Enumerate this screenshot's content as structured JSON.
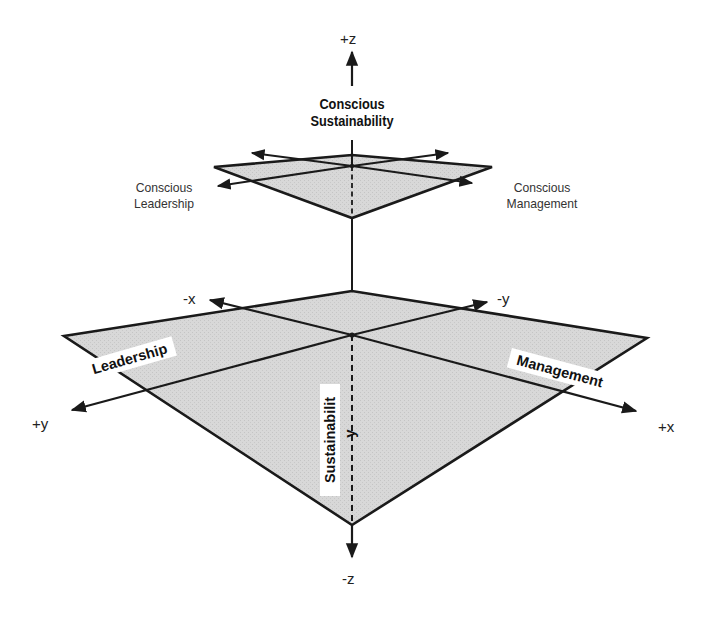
{
  "diagram": {
    "colors": {
      "plane_fill": "#d6d6d6",
      "line": "#1a1a1a",
      "background": "#ffffff"
    },
    "axes": {
      "plus_z": "+z",
      "minus_z": "-z",
      "plus_x": "+x",
      "minus_x": "-x",
      "plus_y": "+y",
      "minus_y": "-y"
    },
    "upper_plane": {
      "title_line1": "Conscious",
      "title_line2": "Sustainability",
      "left_label_line1": "Conscious",
      "left_label_line2": "Leadership",
      "right_label_line1": "Conscious",
      "right_label_line2": "Management"
    },
    "lower_plane": {
      "left_tag": "Leadership",
      "right_tag": "Management",
      "center_tag": "Sustainabilit",
      "center_tag_suffix": "y"
    }
  }
}
